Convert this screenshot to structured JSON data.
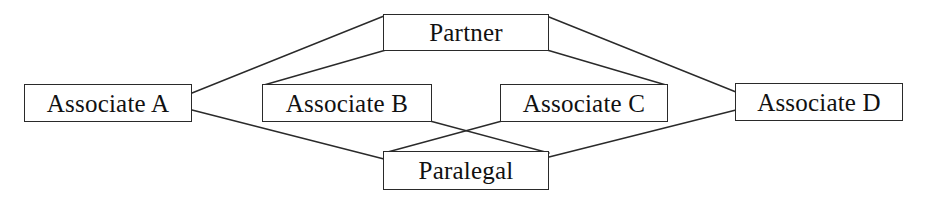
{
  "diagram": {
    "type": "node-link-diagram",
    "background_color": "#ffffff",
    "line_color": "#2a2a2a",
    "text_color": "#111111",
    "nodes": [
      {
        "id": "associate_a",
        "label": "Associate A",
        "x": 24,
        "y": 84,
        "w": 168,
        "h": 38
      },
      {
        "id": "partner",
        "label": "Partner",
        "x": 383,
        "y": 14,
        "w": 166,
        "h": 37
      },
      {
        "id": "associate_b",
        "label": "Associate B",
        "x": 262,
        "y": 84,
        "w": 170,
        "h": 38
      },
      {
        "id": "associate_c",
        "label": "Associate C",
        "x": 500,
        "y": 84,
        "w": 168,
        "h": 38
      },
      {
        "id": "associate_d",
        "label": "Associate D",
        "x": 735,
        "y": 83,
        "w": 168,
        "h": 38
      },
      {
        "id": "paralegal",
        "label": "Paralegal",
        "x": 383,
        "y": 151,
        "w": 166,
        "h": 39
      }
    ],
    "edges": [
      {
        "from": "associate_a",
        "to": "partner",
        "x1": 192,
        "y1": 93,
        "x2": 384,
        "y2": 16
      },
      {
        "from": "associate_a",
        "to": "paralegal",
        "x1": 192,
        "y1": 110,
        "x2": 384,
        "y2": 159
      },
      {
        "from": "partner",
        "to": "associate_b",
        "x1": 386,
        "y1": 50,
        "x2": 264,
        "y2": 85
      },
      {
        "from": "partner",
        "to": "associate_c",
        "x1": 547,
        "y1": 50,
        "x2": 666,
        "y2": 85
      },
      {
        "from": "partner",
        "to": "associate_d",
        "x1": 549,
        "y1": 17,
        "x2": 736,
        "y2": 92
      },
      {
        "from": "associate_b",
        "to": "paralegal",
        "x1": 430,
        "y1": 121,
        "x2": 549,
        "y2": 153
      },
      {
        "from": "associate_c",
        "to": "paralegal",
        "x1": 502,
        "y1": 121,
        "x2": 384,
        "y2": 153
      },
      {
        "from": "associate_d",
        "to": "paralegal",
        "x1": 736,
        "y1": 110,
        "x2": 549,
        "y2": 157
      }
    ]
  }
}
